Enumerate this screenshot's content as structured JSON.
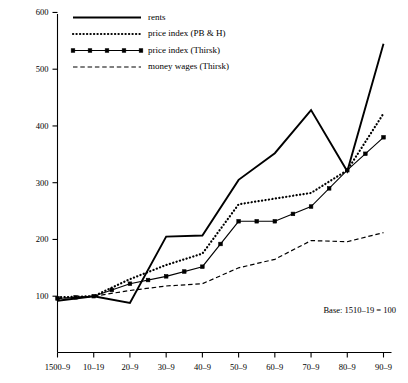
{
  "chart_data": {
    "type": "line",
    "title": "",
    "subtitle": "",
    "xlabel": "",
    "ylabel": "",
    "grid": false,
    "legend_position": "top-left",
    "annotation": "Base: 1510–19 = 100",
    "categories": [
      "1500-9",
      "10-19",
      "20-9",
      "30-9",
      "40-9",
      "50-9",
      "60-9",
      "70-9",
      "80-9",
      "90-9"
    ],
    "x_tick_labels": [
      "1500–9",
      "10–19",
      "20–9",
      "30–9",
      "40–9",
      "50–9",
      "60–9",
      "70–9",
      "80–9",
      "90–9"
    ],
    "y_tick_labels": [
      "100",
      "200",
      "300",
      "400",
      "500",
      "600"
    ],
    "y_ticks": [
      100,
      200,
      300,
      400,
      500,
      600
    ],
    "ylim": [
      0,
      620
    ],
    "series": [
      {
        "name": "rents",
        "style": "solid",
        "values": [
          92,
          100,
          88,
          205,
          207,
          305,
          352,
          428,
          320,
          545
        ]
      },
      {
        "name": "price index (PB & H)",
        "style": "dotted",
        "values": [
          98,
          100,
          130,
          155,
          175,
          262,
          272,
          282,
          322,
          422
        ]
      },
      {
        "name": "price index (Thirsk)",
        "style": "solid-markers",
        "values": [
          96,
          100,
          122,
          135,
          152,
          232,
          232,
          258,
          322,
          380
        ]
      },
      {
        "name": "money wages (Thirsk)",
        "style": "dashed",
        "values": [
          96,
          100,
          110,
          118,
          122,
          150,
          165,
          198,
          196,
          212
        ]
      }
    ]
  },
  "legend": {
    "items": [
      {
        "label": "rents",
        "key": "rents"
      },
      {
        "label": "price index (PB & H)",
        "key": "pbh"
      },
      {
        "label": "price index (Thirsk)",
        "key": "thirsk"
      },
      {
        "label": "money wages (Thirsk)",
        "key": "wages"
      }
    ]
  }
}
